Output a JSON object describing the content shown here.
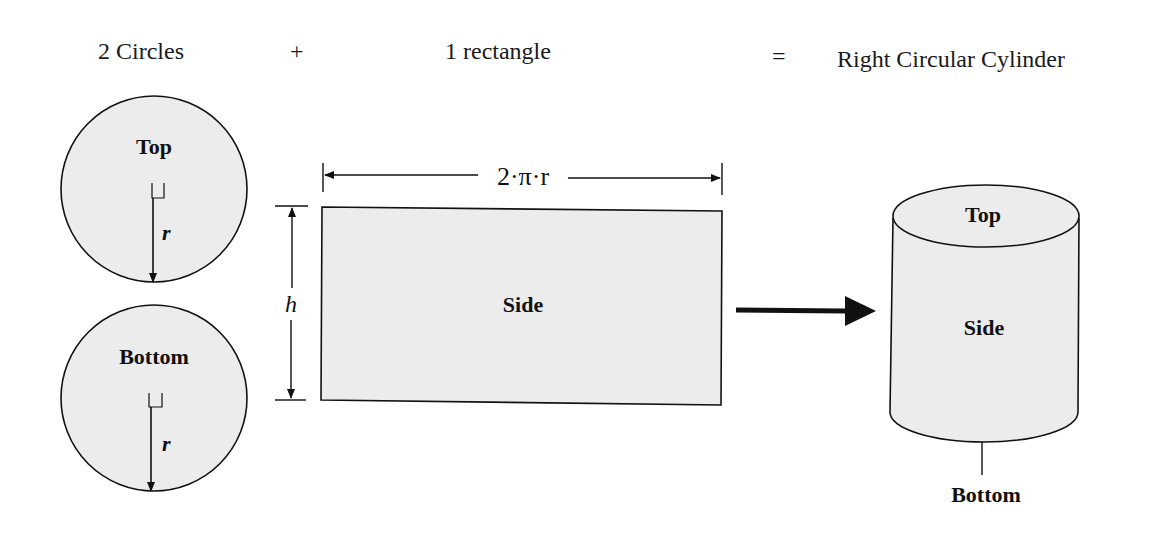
{
  "header": {
    "term1": "2 Circles",
    "plus": "+",
    "term2": "1 rectangle",
    "equals": "=",
    "result": "Right Circular Cylinder"
  },
  "circles": {
    "top": {
      "label": "Top",
      "radius_label": "r"
    },
    "bottom": {
      "label": "Bottom",
      "radius_label": "r"
    }
  },
  "rectangle": {
    "label": "Side",
    "width_label": "2·π·r",
    "height_label": "h"
  },
  "cylinder": {
    "top_label": "Top",
    "side_label": "Side",
    "bottom_label": "Bottom"
  },
  "colors": {
    "fill": "#ececec",
    "stroke": "#111111",
    "background": "#ffffff"
  }
}
